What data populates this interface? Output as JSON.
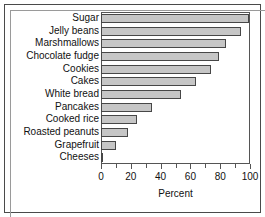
{
  "chart_data": {
    "type": "bar",
    "orientation": "horizontal",
    "title": "",
    "xlabel": "Percent",
    "ylabel": "",
    "xlim": [
      0,
      100
    ],
    "xticks": [
      0,
      20,
      40,
      60,
      80,
      100
    ],
    "xtick_labels": [
      "0",
      "20",
      "40",
      "60",
      "80",
      "100"
    ],
    "minor_ticks": [
      10,
      30,
      50,
      70,
      90
    ],
    "grid": false,
    "legend": null,
    "categories": [
      "Sugar",
      "Jelly beans",
      "Marshmallows",
      "Chocolate fudge",
      "Cookies",
      "Cakes",
      "White bread",
      "Pancakes",
      "Cooked rice",
      "Roasted peanuts",
      "Grapefruit",
      "Cheeses"
    ],
    "values": [
      99,
      94,
      84,
      79,
      74,
      64,
      54,
      34,
      24,
      18,
      10,
      1
    ],
    "bar_color": "#c6c6c6",
    "bar_edge_color": "#474747",
    "axis_color": "#555555",
    "text_color": "#111111",
    "background": "#ffffff"
  },
  "frame": {
    "outer_border_color": "#4a4a4a",
    "plot_border_color": "#555555"
  }
}
